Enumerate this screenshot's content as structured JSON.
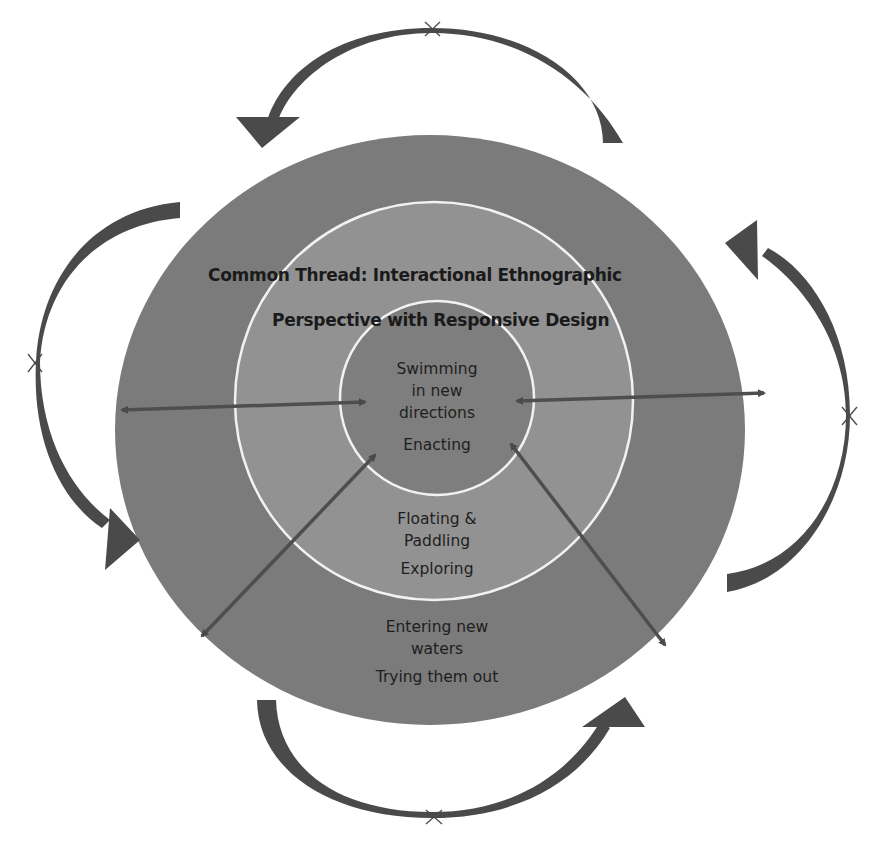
{
  "diagram": {
    "title_lines": [
      "Common Thread: Interactional Ethnographic",
      "Perspective with Responsive Design"
    ],
    "rings": [
      {
        "id": "inner",
        "metaphor_lines": [
          "Swimming",
          "in new",
          "directions"
        ],
        "action": "Enacting"
      },
      {
        "id": "middle",
        "metaphor_lines": [
          "Floating &",
          "Paddling"
        ],
        "action": "Exploring"
      },
      {
        "id": "outer",
        "metaphor_lines": [
          "Entering new",
          "waters"
        ],
        "action": "Trying them out"
      }
    ],
    "colors": {
      "outer_ring": "#7b7b7b",
      "middle_ring": "#929292",
      "inner_circle": "#7e7e7e",
      "ring_border": "#f2f2f2",
      "arrow": "#4a4a4a",
      "background": "#ffffff"
    },
    "cycle_arrows": [
      {
        "position": "top",
        "direction": "counter-clockwise",
        "marker": "x"
      },
      {
        "position": "left",
        "direction": "counter-clockwise",
        "marker": "x"
      },
      {
        "position": "bottom",
        "direction": "counter-clockwise",
        "marker": "x"
      },
      {
        "position": "right",
        "direction": "counter-clockwise",
        "marker": "x"
      }
    ],
    "connector_arrows": [
      {
        "position": "left",
        "type": "double-headed"
      },
      {
        "position": "right",
        "type": "double-headed"
      },
      {
        "position": "lower-left",
        "type": "double-headed"
      },
      {
        "position": "lower-right",
        "type": "double-headed"
      }
    ]
  }
}
